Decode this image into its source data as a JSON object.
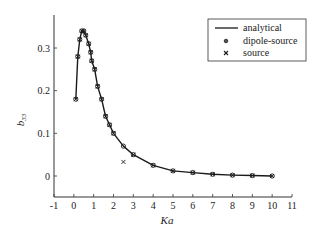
{
  "chart_data": {
    "type": "line",
    "title": "",
    "xlabel": "Ka",
    "ylabel": "b33",
    "ylabel_main": "b",
    "ylabel_sub": "33",
    "xlim": [
      -1,
      11
    ],
    "ylim": [
      -0.05,
      0.37
    ],
    "x_ticks": [
      -1,
      0,
      1,
      2,
      3,
      4,
      5,
      6,
      7,
      8,
      9,
      10,
      11
    ],
    "x_tick_labels": [
      "-1",
      "0",
      "1",
      "2",
      "3",
      "4",
      "5",
      "6",
      "7",
      "8",
      "9",
      "10",
      "11"
    ],
    "y_ticks": [
      0,
      0.1,
      0.2,
      0.3
    ],
    "y_tick_labels": [
      "0",
      "0.1",
      "0.2",
      "0.3"
    ],
    "grid": false,
    "legend_position": "upper right",
    "legend": [
      {
        "label": "analytical",
        "marker": "line"
      },
      {
        "label": "dipole-source",
        "marker": "circle"
      },
      {
        "label": "source",
        "marker": "x"
      }
    ],
    "series": [
      {
        "name": "analytical",
        "style": "line",
        "x": [
          0.1,
          0.2,
          0.3,
          0.4,
          0.5,
          0.6,
          0.75,
          0.85,
          0.9,
          1.05,
          1.2,
          1.4,
          1.6,
          1.8,
          2.0,
          2.5,
          3.0,
          4.0,
          5.0,
          6.0,
          7.0,
          8.0,
          9.0,
          10.0
        ],
        "y": [
          0.18,
          0.28,
          0.32,
          0.34,
          0.34,
          0.33,
          0.31,
          0.29,
          0.27,
          0.25,
          0.21,
          0.18,
          0.14,
          0.12,
          0.1,
          0.07,
          0.05,
          0.025,
          0.012,
          0.008,
          0.004,
          0.002,
          0.001,
          0.0
        ]
      },
      {
        "name": "dipole-source",
        "style": "circle",
        "x": [
          0.1,
          0.2,
          0.3,
          0.4,
          0.5,
          0.6,
          0.75,
          0.85,
          0.9,
          1.05,
          1.2,
          1.4,
          1.6,
          1.8,
          2.0,
          2.5,
          3.0,
          4.0,
          5.0,
          6.0,
          7.0,
          8.0,
          9.0,
          10.0
        ],
        "y": [
          0.18,
          0.28,
          0.32,
          0.34,
          0.34,
          0.33,
          0.31,
          0.29,
          0.27,
          0.25,
          0.21,
          0.18,
          0.14,
          0.12,
          0.1,
          0.07,
          0.05,
          0.025,
          0.012,
          0.008,
          0.004,
          0.002,
          0.001,
          0.0
        ]
      },
      {
        "name": "source",
        "style": "x",
        "x": [
          0.1,
          0.2,
          0.3,
          0.4,
          0.5,
          0.6,
          0.75,
          0.85,
          0.9,
          1.05,
          1.2,
          1.4,
          1.6,
          1.8,
          2.0,
          2.5,
          3.0,
          4.0,
          5.0,
          6.0,
          7.0,
          8.0,
          9.0,
          10.0
        ],
        "y": [
          0.18,
          0.28,
          0.32,
          0.34,
          0.34,
          0.33,
          0.31,
          0.29,
          0.27,
          0.25,
          0.21,
          0.18,
          0.14,
          0.12,
          0.1,
          0.033,
          0.05,
          0.025,
          0.012,
          0.008,
          0.004,
          0.002,
          0.001,
          0.0
        ]
      }
    ]
  },
  "colors": {
    "line": "#1a1a1a",
    "background": "#ffffff"
  }
}
